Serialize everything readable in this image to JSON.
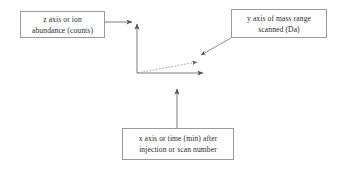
{
  "diagram": {
    "background_color": "#ffffff",
    "line_color": "#6e6e6e",
    "box_border_color": "#9a9a9a",
    "text_color": "#2b2b2b",
    "callouts": {
      "z_axis": {
        "line1": "z axis or ion",
        "line2": "abundance (counts)"
      },
      "y_axis": {
        "line1": "y axis of mass range",
        "line2": "scanned (Da)"
      },
      "x_axis": {
        "line1": "x axis or time (min) after",
        "line2": "injection or scan number"
      }
    },
    "axes": {
      "z_axis_label": "vertical-axis-line",
      "y_axis_label": "dashed-depth-axis-line",
      "x_axis_label": "horizontal-axis-line",
      "origin": "137,73"
    }
  }
}
